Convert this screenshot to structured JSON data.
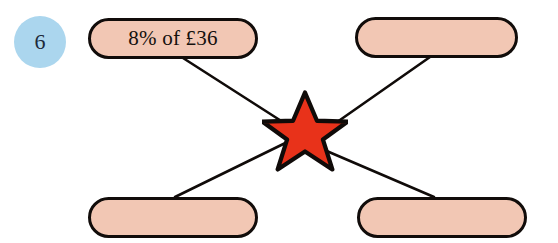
{
  "page": {
    "width": 558,
    "height": 243,
    "background": "#ffffff"
  },
  "question": {
    "number": "6",
    "badge_color": "#ABD6EE",
    "number_color": "#1d2a3a"
  },
  "colors": {
    "pill_fill": "#F2C7B4",
    "pill_border": "#110c0a",
    "star_fill": "#E8321A",
    "star_outline": "#100b09",
    "connector": "#100b09"
  },
  "diagram": {
    "type": "matching-star",
    "center_icon": "star-icon",
    "boxes": [
      {
        "id": "top-left",
        "label": "8% of £36",
        "empty": false
      },
      {
        "id": "top-right",
        "label": "",
        "empty": true
      },
      {
        "id": "bottom-left",
        "label": "",
        "empty": true
      },
      {
        "id": "bottom-right",
        "label": "",
        "empty": true
      }
    ],
    "connectors": [
      {
        "from": "top-left",
        "to": "star"
      },
      {
        "from": "top-right",
        "to": "star"
      },
      {
        "from": "bottom-left",
        "to": "star"
      },
      {
        "from": "bottom-right",
        "to": "star"
      }
    ]
  }
}
